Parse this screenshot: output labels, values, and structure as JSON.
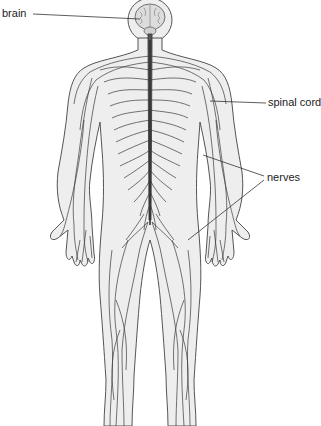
{
  "labels": {
    "brain": "brain",
    "spinal_cord": "spinal cord",
    "nerves": "nerves"
  },
  "colors": {
    "body_fill": "#eeeeee",
    "outline": "#555555",
    "nerve": "#3a3a3a",
    "spinal_cord": "#4a4a4a",
    "brain_fill": "#dcdcdc",
    "text": "#222222"
  }
}
